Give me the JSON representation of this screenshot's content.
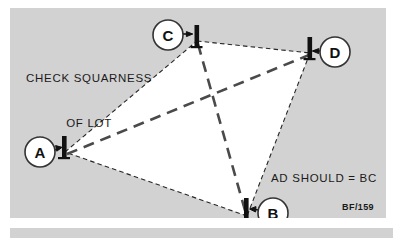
{
  "figure": {
    "plate_code": "BF/159",
    "background_color": "#d2d2d2",
    "lot_fill_color": "#ffffff",
    "line_color": "#262626",
    "text_color": "#1a1a1a"
  },
  "annotations": {
    "check_squareness_line1": "CHECK SQUARNESS",
    "check_squareness_line2": "OF LOT",
    "ad_should_equal_bc": "AD SHOULD = BC"
  },
  "diagram_data": {
    "type": "diagram",
    "title": "CHECK SQUARNESS OF LOT",
    "description": "Surveying lot squareness check: four corner stakes A, B, C, D with dashed perimeter lines and dashed diagonals AD and BC",
    "corners": [
      {
        "id": "A",
        "label": "A",
        "x": 55,
        "y": 144,
        "circle_x": 30,
        "circle_y": 144,
        "arrow_direction": "right"
      },
      {
        "id": "B",
        "label": "B",
        "x": 237,
        "y": 208,
        "circle_x": 263,
        "circle_y": 205,
        "arrow_direction": "left"
      },
      {
        "id": "C",
        "label": "C",
        "x": 187,
        "y": 33,
        "circle_x": 158,
        "circle_y": 27,
        "arrow_direction": "right"
      },
      {
        "id": "D",
        "label": "D",
        "x": 300,
        "y": 45,
        "circle_x": 325,
        "circle_y": 44,
        "arrow_direction": "left"
      }
    ],
    "perimeter_edges": [
      {
        "from": "A",
        "to": "C",
        "style": "fine-dashed"
      },
      {
        "from": "C",
        "to": "D",
        "style": "fine-dashed"
      },
      {
        "from": "D",
        "to": "B",
        "style": "fine-dashed"
      },
      {
        "from": "B",
        "to": "A",
        "style": "fine-dashed"
      }
    ],
    "diagonals": [
      {
        "from": "A",
        "to": "D",
        "style": "bold-dashed"
      },
      {
        "from": "C",
        "to": "B",
        "style": "bold-dashed"
      }
    ]
  }
}
